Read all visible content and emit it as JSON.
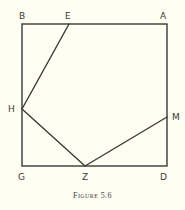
{
  "figure": {
    "caption": "Figure 5.6",
    "colors": {
      "background": "#fefef2",
      "stroke": "#3a3a3a"
    },
    "points": {
      "B": {
        "label": "B",
        "x": 22,
        "y": 24
      },
      "E": {
        "label": "E",
        "x": 69,
        "y": 24
      },
      "A": {
        "label": "A",
        "x": 167,
        "y": 24
      },
      "H": {
        "label": "H",
        "x": 22,
        "y": 109
      },
      "M": {
        "label": "M",
        "x": 167,
        "y": 117
      },
      "G": {
        "label": "G",
        "x": 22,
        "y": 166
      },
      "Z": {
        "label": "Z",
        "x": 85,
        "y": 166
      },
      "D": {
        "label": "D",
        "x": 167,
        "y": 166
      }
    },
    "segments": [
      [
        "B",
        "A"
      ],
      [
        "A",
        "D"
      ],
      [
        "D",
        "G"
      ],
      [
        "G",
        "B"
      ],
      [
        "E",
        "H"
      ],
      [
        "H",
        "Z"
      ],
      [
        "Z",
        "M"
      ]
    ]
  }
}
